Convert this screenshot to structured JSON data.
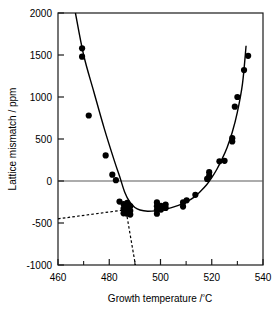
{
  "chart_data": {
    "type": "scatter",
    "title": "",
    "xlabel": "Growth temperature /ºC",
    "ylabel": "Lattice mismatch / ppm",
    "xlim": [
      460,
      540
    ],
    "ylim": [
      -1000,
      2000
    ],
    "xticks": [
      460,
      480,
      500,
      520,
      540
    ],
    "xtick_labels": [
      "460",
      "480",
      "500",
      "520",
      "540"
    ],
    "xminor_ticks": [
      470,
      490,
      510,
      530
    ],
    "yticks": [
      -1000,
      -500,
      0,
      500,
      1000,
      1500,
      2000
    ],
    "ytick_labels": [
      "-1000",
      "-500",
      "0",
      "500",
      "1000",
      "1500",
      "2000"
    ],
    "grid": false,
    "legend": null,
    "zero_line": 0,
    "marker": "filled-circle",
    "marker_color": "#000000",
    "line_color": "#000000",
    "points": [
      [
        469.4,
        1580
      ],
      [
        469.4,
        1480
      ],
      [
        472.0,
        780
      ],
      [
        478.6,
        305
      ],
      [
        481.2,
        75
      ],
      [
        482.6,
        10
      ],
      [
        484.0,
        -245
      ],
      [
        485.6,
        -275
      ],
      [
        485.6,
        -330
      ],
      [
        485.6,
        -385
      ],
      [
        487.0,
        -260
      ],
      [
        487.0,
        -300
      ],
      [
        487.0,
        -345
      ],
      [
        487.0,
        -390
      ],
      [
        488.2,
        -300
      ],
      [
        488.2,
        -355
      ],
      [
        488.2,
        -400
      ],
      [
        498.6,
        -255
      ],
      [
        498.6,
        -300
      ],
      [
        498.6,
        -345
      ],
      [
        498.6,
        -390
      ],
      [
        500.2,
        -295
      ],
      [
        500.2,
        -340
      ],
      [
        502.0,
        -280
      ],
      [
        502.0,
        -320
      ],
      [
        508.8,
        -255
      ],
      [
        508.8,
        -305
      ],
      [
        510.2,
        -230
      ],
      [
        513.6,
        -165
      ],
      [
        518.2,
        25
      ],
      [
        519.0,
        60
      ],
      [
        519.0,
        105
      ],
      [
        523.0,
        235
      ],
      [
        525.0,
        240
      ],
      [
        528.0,
        470
      ],
      [
        528.0,
        510
      ],
      [
        529.0,
        885
      ],
      [
        530.0,
        1000
      ],
      [
        532.6,
        1320
      ],
      [
        534.2,
        1490
      ]
    ],
    "fit_curve": {
      "style": "solid",
      "description": "U-shaped fitted curve through lattice mismatch minimum near 495 °C",
      "points": [
        [
          466.8,
          2000
        ],
        [
          470,
          1500
        ],
        [
          474,
          1060
        ],
        [
          478,
          630
        ],
        [
          482,
          240
        ],
        [
          484,
          60
        ],
        [
          486,
          -130
        ],
        [
          488,
          -250
        ],
        [
          490,
          -315
        ],
        [
          492,
          -345
        ],
        [
          495,
          -360
        ],
        [
          498,
          -355
        ],
        [
          501,
          -340
        ],
        [
          504,
          -320
        ],
        [
          507,
          -290
        ],
        [
          510,
          -250
        ],
        [
          513,
          -195
        ],
        [
          516,
          -110
        ],
        [
          518,
          -45
        ],
        [
          520,
          40
        ],
        [
          522,
          140
        ],
        [
          524,
          260
        ],
        [
          526,
          400
        ],
        [
          528,
          580
        ],
        [
          530,
          820
        ],
        [
          532,
          1160
        ],
        [
          533.4,
          1610
        ]
      ]
    },
    "dashed_lines": [
      {
        "style": "dashed",
        "description": "shallow low-temperature asymptote",
        "points": [
          [
            460,
            -450
          ],
          [
            488.3,
            -335
          ]
        ]
      },
      {
        "style": "dashed",
        "description": "steep descending asymptote",
        "points": [
          [
            486.0,
            -255
          ],
          [
            490.2,
            -1000
          ]
        ]
      }
    ]
  },
  "axis": {
    "y_title": "Lattice mismatch / ppm",
    "x_title_main": "Growth temperature /",
    "x_title_degree": "º",
    "x_title_unit": "C"
  }
}
